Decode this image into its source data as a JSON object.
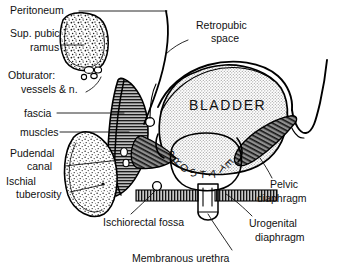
{
  "figure": {
    "background_color": "#ffffff",
    "ink_color": "#111111",
    "width": 338,
    "height": 268
  },
  "labels": {
    "peritoneum": "Peritoneum",
    "sup_pubic_ramus_line1": "Sup. pubic",
    "sup_pubic_ramus_line2": "ramus",
    "obturator_line1": "Obturator:",
    "obturator_line2": "vessels & n.",
    "fascia": "fascia",
    "muscles": "muscles",
    "pudendal_line1": "Pudendal",
    "pudendal_line2": "canal",
    "ischial_line1": "Ischial",
    "ischial_line2": "tuberosity",
    "ischiorectal_fossa": "Ischiorectal fossa",
    "retropubic_line1": "Retropubic",
    "retropubic_line2": "space",
    "bladder": "BLADDER",
    "pelvic_line1": "Pelvic",
    "pelvic_line2": "diaphragm",
    "urogenital_line1": "Urogenital",
    "urogenital_line2": "diaphragm",
    "membranous_urethra": "Membranous urethra"
  },
  "prostate_letters": [
    {
      "ch": "P",
      "x": 176,
      "y": 156,
      "rot": -58
    },
    {
      "ch": "R",
      "x": 180,
      "y": 164,
      "rot": -44
    },
    {
      "ch": "O",
      "x": 186,
      "y": 171,
      "rot": -28
    },
    {
      "ch": "S",
      "x": 194,
      "y": 176,
      "rot": -14
    },
    {
      "ch": "T",
      "x": 203,
      "y": 178,
      "rot": 2
    },
    {
      "ch": "A",
      "x": 212,
      "y": 177,
      "rot": 16
    },
    {
      "ch": "T",
      "x": 220,
      "y": 173,
      "rot": 30
    },
    {
      "ch": "E",
      "x": 227,
      "y": 166,
      "rot": 44
    }
  ],
  "structures": {
    "bladder_fill": "#d8d8d8",
    "bone_fill": "#f2f2f2",
    "muscle_fill": "#8c8c8c",
    "diaphragm_fill": "#9a9a9a",
    "urethra_fill": "#e4e4e4"
  }
}
